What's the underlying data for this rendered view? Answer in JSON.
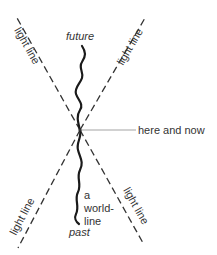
{
  "diagram": {
    "title": "",
    "labels": {
      "future": "future",
      "past": "past",
      "here_and_now": "here and now",
      "world_line_1": "a",
      "world_line_2": "world-",
      "world_line_3": "line",
      "light_line_top_left": "light line",
      "light_line_top_right": "light line",
      "light_line_bottom_left": "light line",
      "light_line_bottom_right": "light line"
    },
    "colors": {
      "line": "#333333",
      "world_line": "#1a1a1a",
      "pointer": "#999999",
      "text": "#333333",
      "background": "#ffffff"
    },
    "nodes": [
      {
        "id": "here-and-now",
        "label": "here and now",
        "x": 80,
        "y": 130
      }
    ],
    "edges": [
      {
        "id": "light-line-tl",
        "type": "dashed",
        "from": [
          80,
          130
        ],
        "to": [
          17,
          18
        ],
        "label": "light line"
      },
      {
        "id": "light-line-tr",
        "type": "dashed",
        "from": [
          80,
          130
        ],
        "to": [
          145,
          18
        ],
        "label": "light line"
      },
      {
        "id": "light-line-bl",
        "type": "dashed",
        "from": [
          80,
          130
        ],
        "to": [
          18,
          248
        ],
        "label": "light line"
      },
      {
        "id": "light-line-br",
        "type": "dashed",
        "from": [
          80,
          130
        ],
        "to": [
          143,
          243
        ],
        "label": "light line"
      },
      {
        "id": "world-line",
        "type": "wavy",
        "from": "past",
        "to": "future",
        "label": "a world-line"
      }
    ]
  }
}
